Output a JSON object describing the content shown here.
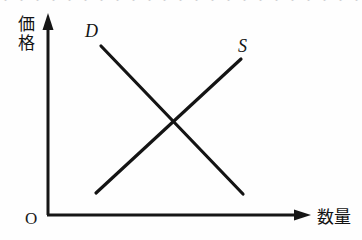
{
  "figure": {
    "kind": "supply-demand-diagram",
    "background_color": "#fefefe",
    "ink_color": "#141414",
    "cut_off_top_text": "・ ・ ・ ・ ・ ・ ・ ・ ・ ・ ・ ・ ・ ・ ・ ・ ・ ・ ・ ・ ・ ・ ・ ・ ・"
  },
  "axes": {
    "y": {
      "label": "価格",
      "label_chars": [
        "価",
        "格"
      ],
      "arrow": "up-arrow-icon",
      "x_px": 48,
      "top_px": 18,
      "bottom_px": 215
    },
    "x": {
      "label": "数量",
      "arrow": "right-arrow-icon",
      "y_px": 215,
      "left_px": 48,
      "right_px": 312
    },
    "origin": {
      "label": "O",
      "x_px": 48,
      "y_px": 215
    }
  },
  "chart_data": {
    "type": "line",
    "title": "",
    "xlabel": "数量",
    "ylabel": "価格",
    "xlim": [
      0,
      362
    ],
    "ylim": [
      0,
      240
    ],
    "grid": false,
    "legend": "inline-curve-labels",
    "axis_scale": "unlabeled-qualitative",
    "series": [
      {
        "name": "D",
        "label": "D",
        "description": "demand-curve",
        "slope": "downward",
        "color": "#141414",
        "line_width_px": 3.2,
        "x": [
          101,
          243
        ],
        "y": [
          46,
          194
        ],
        "points": [
          {
            "x": 101,
            "y": 46
          },
          {
            "x": 243,
            "y": 194
          }
        ],
        "label_position": {
          "x": 85,
          "y": 21
        }
      },
      {
        "name": "S",
        "label": "S",
        "description": "supply-curve",
        "slope": "upward",
        "color": "#141414",
        "line_width_px": 3.2,
        "x": [
          96,
          241
        ],
        "y": [
          193,
          59
        ],
        "points": [
          {
            "x": 96,
            "y": 193
          },
          {
            "x": 241,
            "y": 59
          }
        ],
        "label_position": {
          "x": 238,
          "y": 36
        }
      }
    ],
    "annotations": [
      {
        "name": "equilibrium-intersection",
        "x": 175,
        "y": 122,
        "label": ""
      }
    ]
  }
}
